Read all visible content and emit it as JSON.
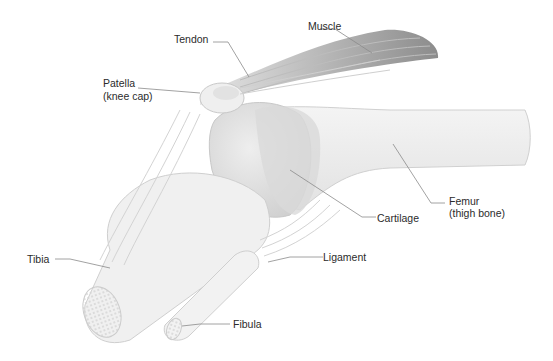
{
  "diagram": {
    "labels": {
      "muscle": "Muscle",
      "tendon": "Tendon",
      "patella_line1": "Patella",
      "patella_line2": "(knee cap)",
      "femur_line1": "Femur",
      "femur_line2": "(thigh bone)",
      "cartilage": "Cartilage",
      "ligament": "Ligament",
      "tibia": "Tibia",
      "fibula": "Fibula"
    },
    "colors": {
      "background": "#ffffff",
      "bone": "#ededed",
      "bone_shade": "#d6d6d6",
      "muscle": "#9a9a9a",
      "leader_line": "#8a8a8a",
      "text": "#2b2b2b"
    }
  }
}
